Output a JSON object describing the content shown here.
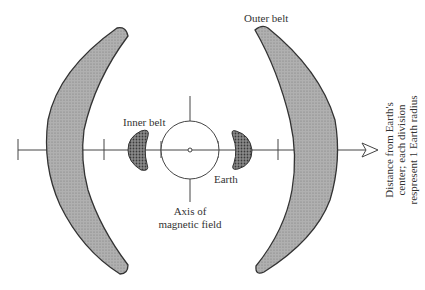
{
  "diagram": {
    "labels": {
      "outer_belt": "Outer belt",
      "inner_belt": "Inner belt",
      "earth": "Earth",
      "axis_line1": "Axis of",
      "axis_line2": "magnetic field",
      "distance_line1": "Distance from Earth's",
      "distance_line2": "center; each division",
      "distance_line3": "respresent 1 Earth radius"
    },
    "colors": {
      "outer_belt_fill": "#a8a8a8",
      "inner_belt_fill": "#6a6a6a",
      "stroke": "#333333"
    }
  }
}
